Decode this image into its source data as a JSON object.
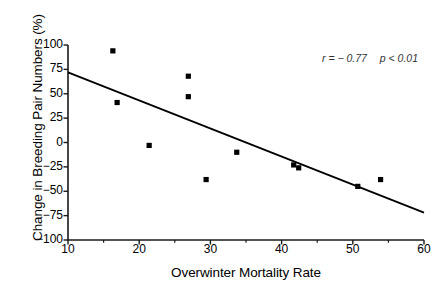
{
  "chart_data": {
    "type": "scatter",
    "title": "",
    "xlabel": "Overwinter Mortality Rate",
    "ylabel": "Change in Breeding Pair Numbers (%)",
    "xlim": [
      10,
      60
    ],
    "ylim": [
      -100,
      100
    ],
    "xticks": [
      10,
      20,
      30,
      40,
      50,
      60
    ],
    "xticklabels": [
      "10",
      "20",
      "30",
      "40",
      "50",
      "60"
    ],
    "xminorticks": [
      15,
      25,
      35,
      45,
      55
    ],
    "yticks": [
      100,
      75,
      50,
      25,
      0,
      -25,
      -50,
      -75,
      -100
    ],
    "yticklabels": [
      "100",
      "75",
      "50",
      "25",
      "0",
      "−25",
      "−50",
      "−75",
      "−100"
    ],
    "grid": false,
    "legend": null,
    "marker": "square",
    "marker_color": "#000000",
    "points": [
      {
        "x": 16.3,
        "y": 94
      },
      {
        "x": 16.9,
        "y": 41
      },
      {
        "x": 21.4,
        "y": -3
      },
      {
        "x": 26.9,
        "y": 68
      },
      {
        "x": 26.9,
        "y": 47
      },
      {
        "x": 29.4,
        "y": -38
      },
      {
        "x": 33.7,
        "y": -10
      },
      {
        "x": 41.7,
        "y": -23
      },
      {
        "x": 42.4,
        "y": -26
      },
      {
        "x": 50.7,
        "y": -45
      },
      {
        "x": 53.9,
        "y": -38
      }
    ],
    "trendline": {
      "x1": 10,
      "y1": 72,
      "x2": 60,
      "y2": -72,
      "color": "#000000"
    },
    "annotations": [
      {
        "text": "r = − 0.77",
        "text2": "p < 0.01",
        "x": 52,
        "y": 83
      }
    ]
  },
  "annotation": {
    "r_text": "r = − 0.77",
    "p_text": "p < 0.01"
  },
  "axes": {
    "x_title": "Overwinter Mortality Rate",
    "y_title": "Change in Breeding Pair Numbers (%)"
  }
}
